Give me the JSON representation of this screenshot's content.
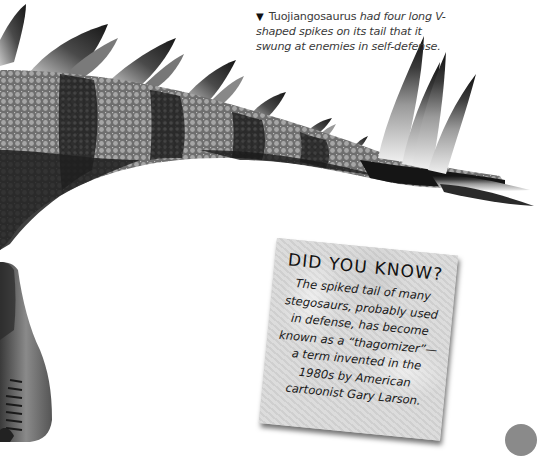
{
  "page": {
    "caption": {
      "marker": "▼",
      "subject": "Tuojiangosaurus",
      "text": "had four long V-shaped spikes on its tail that it swung at enemies in self-defense."
    },
    "did_you_know": {
      "title": "DID YOU KNOW?",
      "lines": [
        "The spiked tail of many",
        "stegosaurs, probably used",
        "in defense, has become",
        "known as a “thagomizer”—",
        "a term invented in the",
        "1980s by American",
        "cartoonist Gary Larson."
      ]
    },
    "illustration": {
      "subject": "Tuojiangosaurus tail with thagomizer spikes",
      "colors": {
        "skin_light": "#8e8e8e",
        "skin_dark": "#2a2a2a",
        "spike_light": "#e6e6e6",
        "spike_dark": "#1c1c1c"
      }
    },
    "page_tab": {
      "color": "#8a8a8a"
    }
  }
}
